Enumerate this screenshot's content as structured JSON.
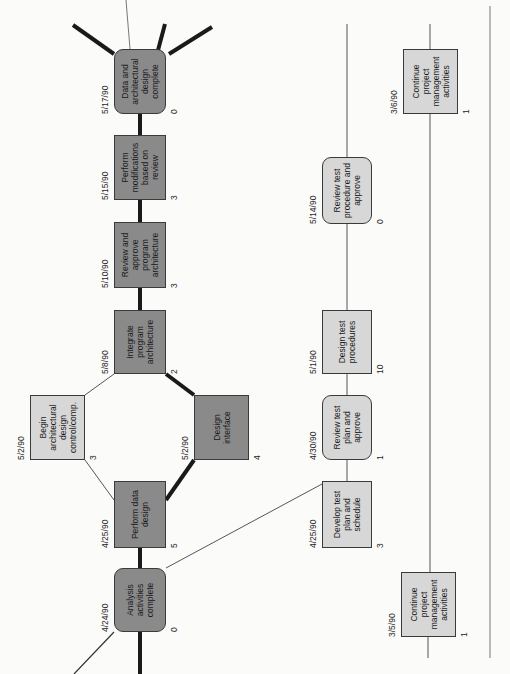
{
  "diagram": {
    "type": "activity network (PERT) diagram",
    "orientation": "rotated 90 degrees counter-clockwise",
    "colors": {
      "critical_node_fill": "#8a8a8a",
      "normal_node_fill": "#d7d7d7",
      "critical_edge": "#1a1a1a",
      "normal_edge": "#555555",
      "background": "#fbfbfa"
    },
    "nodes": [
      {
        "id": "analysis",
        "label": "Analysis activities complete",
        "date": "4/24/90",
        "duration": "0",
        "critical": true,
        "shape": "rounded"
      },
      {
        "id": "data_design",
        "label": "Perform data design",
        "date": "4/25/90",
        "duration": "5",
        "critical": true,
        "shape": "rect"
      },
      {
        "id": "begin_arch",
        "label": "Begin architectural design control/comp.",
        "date": "5/2/90",
        "duration": "3",
        "critical": false,
        "shape": "rect"
      },
      {
        "id": "design_interface",
        "label": "Design interface",
        "date": "5/2/90",
        "duration": "4",
        "critical": true,
        "shape": "rect"
      },
      {
        "id": "integrate",
        "label": "Integrate program architecture",
        "date": "5/8/90",
        "duration": "2",
        "critical": true,
        "shape": "rect"
      },
      {
        "id": "review_arch",
        "label": "Review and approve program architecture",
        "date": "5/10/90",
        "duration": "3",
        "critical": true,
        "shape": "rect"
      },
      {
        "id": "modifications",
        "label": "Perform modifications based on review",
        "date": "5/15/90",
        "duration": "3",
        "critical": true,
        "shape": "rect"
      },
      {
        "id": "arch_complete",
        "label": "Data and architectural design complete",
        "date": "5/17/90",
        "duration": "0",
        "critical": true,
        "shape": "rounded"
      },
      {
        "id": "test_plan",
        "label": "Develop test plan and schedule",
        "date": "4/25/90",
        "duration": "3",
        "critical": false,
        "shape": "rect"
      },
      {
        "id": "review_test_plan",
        "label": "Review test plan and approve",
        "date": "4/30/90",
        "duration": "1",
        "critical": false,
        "shape": "rounded"
      },
      {
        "id": "test_procedures",
        "label": "Design test procedures",
        "date": "5/1/90",
        "duration": "10",
        "critical": false,
        "shape": "rect"
      },
      {
        "id": "review_test_proc",
        "label": "Review test procedure and approve",
        "date": "5/14/90",
        "duration": "0",
        "critical": false,
        "shape": "rounded"
      },
      {
        "id": "pm_1",
        "label": "Continue project management activities",
        "date": "3/5/90",
        "duration": "1",
        "critical": false,
        "shape": "rect"
      },
      {
        "id": "pm_2",
        "label": "Continue project management activities",
        "date": "3/6/90",
        "duration": "1",
        "critical": false,
        "shape": "rect"
      }
    ],
    "edges": [
      {
        "from": "analysis",
        "to": "data_design",
        "critical": true
      },
      {
        "from": "data_design",
        "to": "begin_arch",
        "critical": false
      },
      {
        "from": "data_design",
        "to": "design_interface",
        "critical": true
      },
      {
        "from": "begin_arch",
        "to": "integrate",
        "critical": false
      },
      {
        "from": "design_interface",
        "to": "integrate",
        "critical": true
      },
      {
        "from": "integrate",
        "to": "review_arch",
        "critical": true
      },
      {
        "from": "review_arch",
        "to": "modifications",
        "critical": true
      },
      {
        "from": "modifications",
        "to": "arch_complete",
        "critical": true
      },
      {
        "from": "analysis",
        "to": "test_plan",
        "critical": false
      },
      {
        "from": "test_plan",
        "to": "review_test_plan",
        "critical": false
      },
      {
        "from": "review_test_plan",
        "to": "test_procedures",
        "critical": false
      },
      {
        "from": "test_procedures",
        "to": "review_test_proc",
        "critical": false
      },
      {
        "from": "pm_1",
        "to": "pm_2",
        "critical": false
      }
    ]
  }
}
